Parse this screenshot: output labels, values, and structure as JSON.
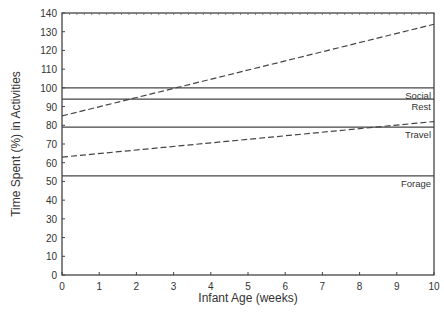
{
  "chart_data": {
    "type": "line",
    "title": "",
    "xlabel": "Infant Age (weeks)",
    "ylabel": "Time Spent (%) in Activities",
    "xlim": [
      0,
      10
    ],
    "ylim": [
      0,
      140
    ],
    "xticks": [
      0,
      1,
      2,
      3,
      4,
      5,
      6,
      7,
      8,
      9,
      10
    ],
    "yticks": [
      0,
      10,
      20,
      30,
      40,
      50,
      60,
      70,
      80,
      90,
      100,
      110,
      120,
      130,
      140
    ],
    "grid": false,
    "legend": "inline labels at right edge",
    "x": [
      0,
      10
    ],
    "series": [
      {
        "name": "Social",
        "style": "solid",
        "values": [
          100,
          100
        ]
      },
      {
        "name": "Rest",
        "style": "solid",
        "values": [
          94,
          94
        ]
      },
      {
        "name": "Travel",
        "style": "solid",
        "values": [
          79,
          79
        ]
      },
      {
        "name": "Forage",
        "style": "solid",
        "values": [
          53,
          53
        ]
      },
      {
        "name": "Upper dashed trend",
        "style": "dashed",
        "values": [
          85,
          134
        ]
      },
      {
        "name": "Lower dashed trend",
        "style": "dashed",
        "values": [
          63,
          82
        ]
      }
    ],
    "annotations": [
      {
        "text": "Social",
        "x": 10,
        "y": 100
      },
      {
        "text": "Rest",
        "x": 10,
        "y": 94
      },
      {
        "text": "Travel",
        "x": 10,
        "y": 79
      },
      {
        "text": "Forage",
        "x": 10,
        "y": 53
      }
    ]
  }
}
